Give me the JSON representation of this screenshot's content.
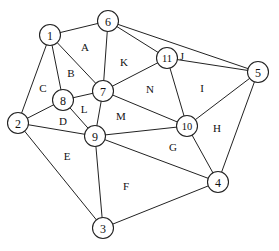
{
  "diagram": {
    "type": "planar-graph",
    "nodes": [
      {
        "id": "1",
        "label": "1",
        "x": 50,
        "y": 35
      },
      {
        "id": "2",
        "label": "2",
        "x": 18,
        "y": 123
      },
      {
        "id": "3",
        "label": "3",
        "x": 103,
        "y": 228
      },
      {
        "id": "4",
        "label": "4",
        "x": 218,
        "y": 182
      },
      {
        "id": "5",
        "label": "5",
        "x": 258,
        "y": 72
      },
      {
        "id": "6",
        "label": "6",
        "x": 108,
        "y": 21
      },
      {
        "id": "7",
        "label": "7",
        "x": 103,
        "y": 91
      },
      {
        "id": "8",
        "label": "8",
        "x": 63,
        "y": 100
      },
      {
        "id": "9",
        "label": "9",
        "x": 95,
        "y": 136
      },
      {
        "id": "10",
        "label": "10",
        "x": 187,
        "y": 126
      },
      {
        "id": "11",
        "label": "11",
        "x": 167,
        "y": 58
      }
    ],
    "edges": [
      [
        "1",
        "6"
      ],
      [
        "1",
        "7"
      ],
      [
        "1",
        "8"
      ],
      [
        "1",
        "2"
      ],
      [
        "6",
        "7"
      ],
      [
        "6",
        "11"
      ],
      [
        "6",
        "5"
      ],
      [
        "11",
        "7"
      ],
      [
        "11",
        "5"
      ],
      [
        "11",
        "10"
      ],
      [
        "7",
        "8"
      ],
      [
        "7",
        "9"
      ],
      [
        "7",
        "10"
      ],
      [
        "8",
        "2"
      ],
      [
        "8",
        "9"
      ],
      [
        "2",
        "9"
      ],
      [
        "2",
        "3"
      ],
      [
        "9",
        "10"
      ],
      [
        "9",
        "4"
      ],
      [
        "9",
        "3"
      ],
      [
        "10",
        "5"
      ],
      [
        "10",
        "4"
      ],
      [
        "5",
        "4"
      ],
      [
        "3",
        "4"
      ]
    ],
    "regions": [
      {
        "label": "A",
        "x": 85,
        "y": 47
      },
      {
        "label": "B",
        "x": 71,
        "y": 73
      },
      {
        "label": "C",
        "x": 43,
        "y": 88
      },
      {
        "label": "D",
        "x": 63,
        "y": 121
      },
      {
        "label": "E",
        "x": 67,
        "y": 156
      },
      {
        "label": "F",
        "x": 126,
        "y": 186
      },
      {
        "label": "G",
        "x": 173,
        "y": 147
      },
      {
        "label": "H",
        "x": 217,
        "y": 128
      },
      {
        "label": "I",
        "x": 202,
        "y": 88
      },
      {
        "label": "J",
        "x": 182,
        "y": 56
      },
      {
        "label": "K",
        "x": 124,
        "y": 62
      },
      {
        "label": "L",
        "x": 84,
        "y": 109
      },
      {
        "label": "M",
        "x": 121,
        "y": 116
      },
      {
        "label": "N",
        "x": 150,
        "y": 89
      }
    ],
    "colors": {
      "stroke": "#222222",
      "background": "#ffffff",
      "text": "#111111"
    }
  }
}
